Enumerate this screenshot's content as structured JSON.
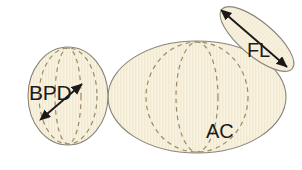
{
  "figure": {
    "background_color": "#ffffff",
    "fill_color": "#f7f1df",
    "stripe_color": "#efe6cd",
    "outline_color": "#8a8578",
    "dashed_color": "#9b8a68",
    "arrow_color": "#1c1a17",
    "label_color": "#1c1a17"
  },
  "shapes": {
    "head": {
      "name": "fetal-head",
      "label": "BPD",
      "label_meaning": "Biparietal diameter",
      "shape": "ellipse",
      "cx": 68,
      "cy": 96,
      "rx": 40,
      "ry": 49,
      "label_x": 29,
      "label_y": 100,
      "measurement_arrow": {
        "x1": 47,
        "y1": 114,
        "x2": 82,
        "y2": 84,
        "double_headed": true
      },
      "dashed_arcs": [
        {
          "cx": 68,
          "cy": 96,
          "rx": 13,
          "ry": 48
        },
        {
          "cx": 68,
          "cy": 96,
          "rx": 29,
          "ry": 48
        }
      ]
    },
    "abdomen": {
      "name": "fetal-abdomen",
      "label": "AC",
      "label_meaning": "Abdominal circumference",
      "shape": "ellipse",
      "cx": 197,
      "cy": 97,
      "rx": 89,
      "ry": 56,
      "label_x": 206,
      "label_y": 138,
      "dashed_arcs": [
        {
          "cx": 197,
          "cy": 97,
          "rx": 21,
          "ry": 55
        },
        {
          "cx": 197,
          "cy": 97,
          "rx": 51,
          "ry": 55
        }
      ]
    },
    "femur": {
      "name": "fetal-femur",
      "label": "FL",
      "label_meaning": "Femur length",
      "shape": "ellipse",
      "cx": 257,
      "cy": 39,
      "rx": 46,
      "ry": 17,
      "rotation": 40,
      "label_x": 247,
      "label_y": 57,
      "measurement_arrow": {
        "x1": 228,
        "y1": 16,
        "x2": 287,
        "y2": 67,
        "double_headed": true
      }
    }
  }
}
